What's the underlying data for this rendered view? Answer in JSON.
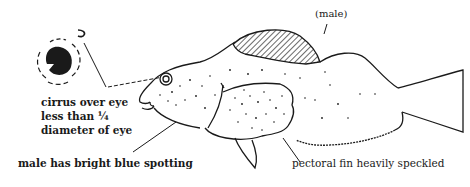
{
  "figure": {
    "colors": {
      "ink": "#1a1a1a",
      "background": "#ffffff"
    }
  },
  "labels": {
    "sex": "(male)",
    "cirrus": {
      "line1": "cirrus over eye",
      "line2": "less than ¼",
      "line3": "diameter of eye"
    },
    "spotting": "male has bright blue spotting",
    "pectoral": "pectoral fin heavily speckled"
  },
  "inset": {
    "name": "eye-detail-inset"
  }
}
